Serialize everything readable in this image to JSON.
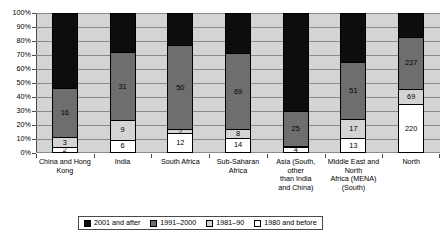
{
  "chart_data": {
    "type": "bar",
    "subtype": "stacked-100-percent",
    "title": "",
    "xlabel": "",
    "ylabel": "",
    "ylim": [
      0,
      100
    ],
    "ytick_labels": [
      "0%",
      "10%",
      "20%",
      "30%",
      "40%",
      "50%",
      "60%",
      "70%",
      "80%",
      "90%",
      "100%"
    ],
    "ytick_values": [
      0,
      10,
      20,
      30,
      40,
      50,
      60,
      70,
      80,
      90,
      100
    ],
    "grid": true,
    "legend_position": "bottom",
    "categories": [
      "China and Hong Kong",
      "India",
      "South Africa",
      "Sub-Saharan Africa",
      "Asia (South, other than India and China)",
      "Middle East and North Africa (MENA) (South)",
      "North"
    ],
    "series": [
      {
        "name": "2001 and after",
        "color": "#0d0d0d",
        "values": [
          24,
          18,
          19,
          37,
          71,
          43,
          106
        ]
      },
      {
        "name": "1991–2000",
        "color": "#6e6e6e",
        "values": [
          16,
          31,
          50,
          69,
          25,
          51,
          237
        ]
      },
      {
        "name": "1981–90",
        "color": "#d4d4d4",
        "values": [
          3,
          9,
          2,
          8,
          1,
          17,
          69
        ]
      },
      {
        "name": "1980 and before",
        "color": "#ffffff",
        "values": [
          2,
          6,
          12,
          14,
          4,
          13,
          220
        ]
      }
    ]
  },
  "bars": [
    {
      "category_lines": [
        "China and Hong",
        "Kong"
      ],
      "segments": [
        {
          "series": "2001 and after",
          "value": 24,
          "label": "24",
          "percent": 53.3,
          "swatch": "c-2001"
        },
        {
          "series": "1991–2000",
          "value": 16,
          "label": "16",
          "percent": 35.6,
          "swatch": "c-1991"
        },
        {
          "series": "1981–90",
          "value": 3,
          "label": "3",
          "percent": 6.7,
          "swatch": "c-1981"
        },
        {
          "series": "1980 and before",
          "value": 2,
          "label": "2",
          "percent": 4.4,
          "swatch": "c-1980"
        }
      ]
    },
    {
      "category_lines": [
        "India"
      ],
      "segments": [
        {
          "series": "2001 and after",
          "value": 18,
          "label": "18",
          "percent": 28.1,
          "swatch": "c-2001"
        },
        {
          "series": "1991–2000",
          "value": 31,
          "label": "31",
          "percent": 48.4,
          "swatch": "c-1991"
        },
        {
          "series": "1981–90",
          "value": 9,
          "label": "9",
          "percent": 14.1,
          "swatch": "c-1981"
        },
        {
          "series": "1980 and before",
          "value": 6,
          "label": "6",
          "percent": 9.4,
          "swatch": "c-1980"
        }
      ]
    },
    {
      "category_lines": [
        "South Africa"
      ],
      "segments": [
        {
          "series": "2001 and after",
          "value": 19,
          "label": "19",
          "percent": 22.9,
          "swatch": "c-2001"
        },
        {
          "series": "1991–2000",
          "value": 50,
          "label": "50",
          "percent": 60.2,
          "swatch": "c-1991"
        },
        {
          "series": "1981–90",
          "value": 2,
          "label": "2",
          "percent": 2.4,
          "swatch": "c-1981"
        },
        {
          "series": "1980 and before",
          "value": 12,
          "label": "12",
          "percent": 14.5,
          "swatch": "c-1980"
        }
      ]
    },
    {
      "category_lines": [
        "Sub-Saharan",
        "Africa"
      ],
      "segments": [
        {
          "series": "2001 and after",
          "value": 37,
          "label": "37",
          "percent": 28.9,
          "swatch": "c-2001"
        },
        {
          "series": "1991–2000",
          "value": 69,
          "label": "69",
          "percent": 53.9,
          "swatch": "c-1991"
        },
        {
          "series": "1981–90",
          "value": 8,
          "label": "8",
          "percent": 6.3,
          "swatch": "c-1981"
        },
        {
          "series": "1980 and before",
          "value": 14,
          "label": "14",
          "percent": 10.9,
          "swatch": "c-1980"
        }
      ]
    },
    {
      "category_lines": [
        "Asia (South,",
        "other",
        "than India",
        "and China)"
      ],
      "segments": [
        {
          "series": "2001 and after",
          "value": 71,
          "label": "71",
          "percent": 70.3,
          "swatch": "c-2001"
        },
        {
          "series": "1991–2000",
          "value": 25,
          "label": "25",
          "percent": 24.8,
          "swatch": "c-1991"
        },
        {
          "series": "1981–90",
          "value": 1,
          "label": "1",
          "percent": 1.0,
          "swatch": "c-1981"
        },
        {
          "series": "1980 and before",
          "value": 4,
          "label": "4",
          "percent": 4.0,
          "swatch": "c-1980"
        }
      ]
    },
    {
      "category_lines": [
        "Middle East and",
        "North",
        "Africa (MENA)",
        "(South)"
      ],
      "segments": [
        {
          "series": "2001 and after",
          "value": 43,
          "label": "43",
          "percent": 34.7,
          "swatch": "c-2001"
        },
        {
          "series": "1991–2000",
          "value": 51,
          "label": "51",
          "percent": 41.1,
          "swatch": "c-1991"
        },
        {
          "series": "1981–90",
          "value": 17,
          "label": "17",
          "percent": 13.7,
          "swatch": "c-1981"
        },
        {
          "series": "1980 and before",
          "value": 13,
          "label": "13",
          "percent": 10.5,
          "swatch": "c-1980"
        }
      ]
    },
    {
      "category_lines": [
        "North"
      ],
      "segments": [
        {
          "series": "2001 and after",
          "value": 106,
          "label": "106",
          "percent": 16.8,
          "swatch": "c-2001"
        },
        {
          "series": "1991–2000",
          "value": 237,
          "label": "237",
          "percent": 37.5,
          "swatch": "c-1991"
        },
        {
          "series": "1981–90",
          "value": 69,
          "label": "69",
          "percent": 10.9,
          "swatch": "c-1981"
        },
        {
          "series": "1980 and before",
          "value": 220,
          "label": "220",
          "percent": 34.8,
          "swatch": "c-1980"
        }
      ]
    }
  ],
  "legend": {
    "items": [
      {
        "label": "2001 and after",
        "swatch": "c-2001"
      },
      {
        "label": "1991–2000",
        "swatch": "c-1991"
      },
      {
        "label": "1981–90",
        "swatch": "c-1981"
      },
      {
        "label": "1980 and before",
        "swatch": "c-1980"
      }
    ]
  }
}
